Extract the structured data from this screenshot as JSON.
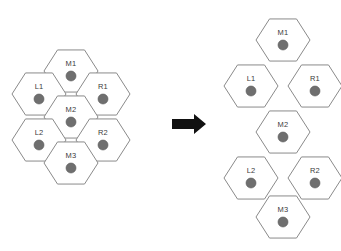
{
  "figure": {
    "background_color": "#ffffff",
    "hex_fill": "#ffffff",
    "hex_stroke": "#8a8a8a",
    "dot_color": "#6f6f6f",
    "label_color": "#3b3b3b",
    "arrow_color": "#111111"
  },
  "arrow": {
    "name": "transformation-arrow",
    "direction": "right",
    "label": ""
  },
  "clusters": [
    {
      "id": "left-cluster",
      "name": "flower-hex-cluster",
      "description": "Seven-cell flower arrangement",
      "cells": [
        {
          "label": "M1",
          "cx": 71,
          "cy": 71,
          "r": 27
        },
        {
          "label": "L1",
          "cx": 39,
          "cy": 94,
          "r": 27
        },
        {
          "label": "R1",
          "cx": 103,
          "cy": 94,
          "r": 27
        },
        {
          "label": "M2",
          "cx": 71,
          "cy": 117,
          "r": 27
        },
        {
          "label": "L2",
          "cx": 39,
          "cy": 140,
          "r": 27
        },
        {
          "label": "R2",
          "cx": 103,
          "cy": 140,
          "r": 27
        },
        {
          "label": "M3",
          "cx": 71,
          "cy": 163,
          "r": 27
        }
      ]
    },
    {
      "id": "right-cluster",
      "name": "chain-hex-cluster",
      "description": "Seven-cell vertical chain arrangement",
      "cells": [
        {
          "label": "M1",
          "cx": 283,
          "cy": 40,
          "r": 27
        },
        {
          "label": "L1",
          "cx": 251,
          "cy": 86,
          "r": 27
        },
        {
          "label": "R1",
          "cx": 315,
          "cy": 86,
          "r": 27
        },
        {
          "label": "M2",
          "cx": 283,
          "cy": 132,
          "r": 27
        },
        {
          "label": "L2",
          "cx": 251,
          "cy": 178,
          "r": 27
        },
        {
          "label": "R2",
          "cx": 315,
          "cy": 178,
          "r": 27
        },
        {
          "label": "M3",
          "cx": 283,
          "cy": 217,
          "r": 27
        }
      ]
    }
  ]
}
